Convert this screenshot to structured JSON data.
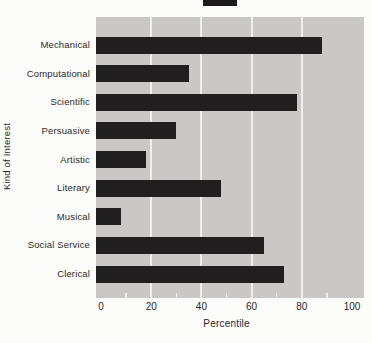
{
  "figure": {
    "ylabel": "Kind of Interest",
    "xlabel": "Percentile"
  },
  "chart_data": {
    "type": "bar",
    "orientation": "horizontal",
    "categories": [
      "Mechanical",
      "Computational",
      "Scientific",
      "Persuasive",
      "Artistic",
      "Literary",
      "Musical",
      "Social Service",
      "Clerical"
    ],
    "values": [
      88,
      35,
      78,
      30,
      18,
      48,
      8,
      65,
      73
    ],
    "title": "",
    "xlabel": "Percentile",
    "ylabel": "Kind of Interest",
    "xlim": [
      0,
      100
    ],
    "xticks": [
      0,
      20,
      40,
      60,
      80,
      100
    ],
    "minor_ticks": [
      10,
      20,
      30,
      40,
      50,
      60,
      70,
      80,
      90
    ],
    "gridlines_at": [
      20,
      40,
      60,
      80
    ],
    "legend": "none",
    "grid": "vertical white gridlines on gray plot background",
    "colors": {
      "bar": "#201e1f",
      "plot_background": "#c9c8c6",
      "page_background": "#fcfcfa",
      "gridline": "#f0efec",
      "text": "#2b2a29"
    }
  },
  "artifact": {
    "description": "small black strip cropped from content above figure, at top edge"
  }
}
